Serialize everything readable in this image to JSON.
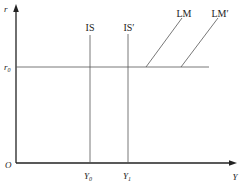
{
  "diagram": {
    "type": "IS-LM liquidity trap",
    "axes": {
      "y_label": "r",
      "x_label": "Y",
      "origin_label": "O"
    },
    "interest_level": {
      "label": "r",
      "subscript": "0"
    },
    "curves": {
      "is": {
        "label": "IS"
      },
      "is_prime": {
        "label": "IS′"
      },
      "lm": {
        "label": "LM"
      },
      "lm_prime": {
        "label": "LM′"
      }
    },
    "output_levels": {
      "y0": {
        "label": "Y",
        "subscript": "0"
      },
      "y1": {
        "label": "Y",
        "subscript": "1"
      }
    },
    "colors": {
      "axis": "#222222",
      "line": "#555555",
      "background": "#ffffff"
    }
  }
}
